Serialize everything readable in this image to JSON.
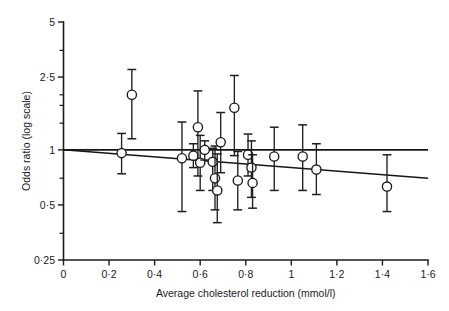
{
  "chart_data": {
    "type": "scatter",
    "title": "",
    "xlabel": "Average cholesterol reduction (mmol/l)",
    "ylabel": "Odds ratio (log scale)",
    "xlim": [
      0,
      1.6
    ],
    "ylim": [
      0.25,
      5
    ],
    "yscale": "log",
    "grid": false,
    "legend": null,
    "xticks": [
      0,
      0.2,
      0.4,
      0.6,
      0.8,
      1.0,
      1.2,
      1.4,
      1.6
    ],
    "xticklabels": [
      "0",
      "0·2",
      "0·4",
      "0·6",
      "0·8",
      "1",
      "1·2",
      "1·4",
      "1·6"
    ],
    "yticks": [
      0.25,
      0.5,
      1,
      2.5,
      5
    ],
    "yticklabels": [
      "0·25",
      "0·5",
      "1",
      "2·5",
      "5"
    ],
    "yminorticks": [
      0.35,
      0.7,
      1.4,
      1.75,
      2.0,
      3.5
    ],
    "marker_style": "open-circle",
    "reference_line": {
      "y": 1.0,
      "label": "null effect"
    },
    "regression_line": {
      "x": [
        0.0,
        1.6
      ],
      "y": [
        1.0,
        0.7
      ],
      "label": "meta-regression"
    },
    "points": [
      {
        "x": 0.255,
        "y": 0.96,
        "ci_low": 0.74,
        "ci_high": 1.23
      },
      {
        "x": 0.3,
        "y": 2.0,
        "ci_low": 1.15,
        "ci_high": 2.75
      },
      {
        "x": 0.52,
        "y": 0.9,
        "ci_low": 0.46,
        "ci_high": 1.42
      },
      {
        "x": 0.57,
        "y": 0.93,
        "ci_low": 0.8,
        "ci_high": 1.08
      },
      {
        "x": 0.59,
        "y": 1.33,
        "ci_low": 0.72,
        "ci_high": 2.1
      },
      {
        "x": 0.6,
        "y": 0.85,
        "ci_low": 0.6,
        "ci_high": 1.2
      },
      {
        "x": 0.62,
        "y": 1.0,
        "ci_low": 0.88,
        "ci_high": 1.12
      },
      {
        "x": 0.655,
        "y": 0.86,
        "ci_low": 0.6,
        "ci_high": 1.02
      },
      {
        "x": 0.665,
        "y": 0.7,
        "ci_low": 0.47,
        "ci_high": 1.05
      },
      {
        "x": 0.675,
        "y": 0.6,
        "ci_low": 0.4,
        "ci_high": 0.95
      },
      {
        "x": 0.69,
        "y": 1.1,
        "ci_low": 0.75,
        "ci_high": 1.6
      },
      {
        "x": 0.75,
        "y": 1.7,
        "ci_low": 0.93,
        "ci_high": 2.55
      },
      {
        "x": 0.765,
        "y": 0.68,
        "ci_low": 0.47,
        "ci_high": 0.98
      },
      {
        "x": 0.81,
        "y": 0.94,
        "ci_low": 0.72,
        "ci_high": 1.22
      },
      {
        "x": 0.825,
        "y": 0.8,
        "ci_low": 0.55,
        "ci_high": 1.12
      },
      {
        "x": 0.83,
        "y": 0.66,
        "ci_low": 0.48,
        "ci_high": 0.94
      },
      {
        "x": 0.925,
        "y": 0.92,
        "ci_low": 0.6,
        "ci_high": 1.33
      },
      {
        "x": 1.05,
        "y": 0.92,
        "ci_low": 0.6,
        "ci_high": 1.37
      },
      {
        "x": 1.11,
        "y": 0.78,
        "ci_low": 0.57,
        "ci_high": 1.08
      },
      {
        "x": 1.42,
        "y": 0.63,
        "ci_low": 0.46,
        "ci_high": 0.94
      }
    ]
  },
  "axes": {
    "y_label": "Odds ratio (log scale)",
    "x_label": "Average cholesterol reduction (mmol/l)"
  }
}
